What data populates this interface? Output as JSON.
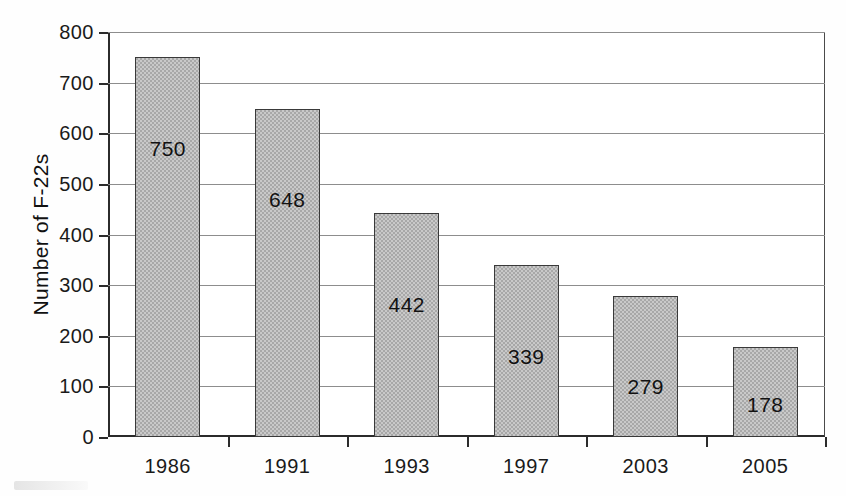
{
  "chart_data": {
    "type": "bar",
    "title": "",
    "xlabel": "",
    "ylabel": "Number of F-22s",
    "categories": [
      "1986",
      "1991",
      "1993",
      "1997",
      "2003",
      "2005"
    ],
    "values": [
      750,
      648,
      442,
      339,
      279,
      178
    ],
    "data_labels": [
      "750",
      "648",
      "442",
      "339",
      "279",
      "178"
    ],
    "ylim": [
      0,
      800
    ],
    "ytick_step": 100,
    "ytick_labels": [
      "0",
      "100",
      "200",
      "300",
      "400",
      "500",
      "600",
      "700",
      "800"
    ],
    "grid": "horizontal",
    "legend": "none",
    "bar_fill_color": "#a8a8a8",
    "bar_border_color": "#3a3a3a",
    "axis_color": "#2b2b2b",
    "gridline_color": "#8d8d8d",
    "background_color": "#ffffff",
    "series": [
      {
        "name": "Number of F-22s",
        "values": [
          750,
          648,
          442,
          339,
          279,
          178
        ]
      }
    ]
  }
}
